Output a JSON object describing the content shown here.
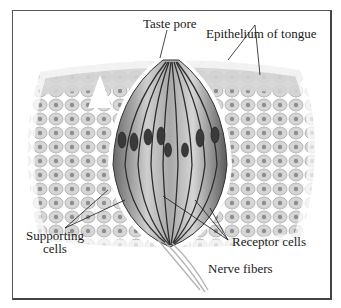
{
  "figure": {
    "labels": {
      "taste_pore": "Taste pore",
      "epithelium": "Epithelium of tongue",
      "supporting_line1": "Supporting",
      "supporting_line2": "cells",
      "receptor_cells": "Receptor cells",
      "nerve_fibers": "Nerve fibers"
    },
    "colors": {
      "ink": "#1a1a1a",
      "tissue_light": "#d8d8d8",
      "tissue_mid": "#9a9a9a",
      "tissue_dark": "#4a4a4a",
      "border": "#555555"
    }
  }
}
